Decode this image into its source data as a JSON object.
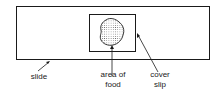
{
  "diagram": {
    "title": "",
    "labels": {
      "slide": "slide",
      "area_line1": "area of",
      "area_line2": "food",
      "cover_line1": "cover",
      "cover_line2": "slip"
    },
    "colors": {
      "stroke": "#1a1a1a",
      "fill": "#ffffff",
      "dot": "#555555"
    }
  }
}
